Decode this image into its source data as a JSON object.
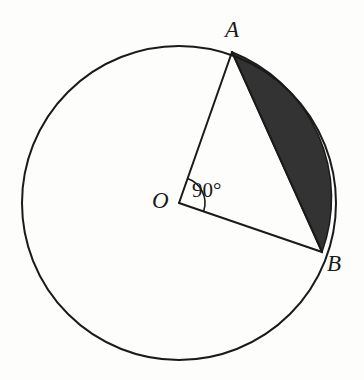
{
  "figure": {
    "background_color": "#fdfdfc",
    "stroke_color": "#1a1a1a",
    "shaded_fill_color": "#333333",
    "circle": {
      "center_x": 179,
      "center_y": 203,
      "radius": 157,
      "stroke_width": 2
    },
    "labels": {
      "point_a": "A",
      "point_b": "B",
      "center_o": "O",
      "angle": "90°"
    },
    "points": {
      "a": {
        "x": 232,
        "y": 52
      },
      "b": {
        "x": 322,
        "y": 252
      },
      "o": {
        "x": 179,
        "y": 203
      }
    },
    "radii": [
      {
        "name": "OA",
        "from": "O",
        "to": "A"
      },
      {
        "name": "OB",
        "from": "O",
        "to": "B"
      }
    ],
    "chord": {
      "name": "AB",
      "from": "A",
      "to": "B"
    },
    "shaded_region": {
      "name": "minor-segment-AB",
      "description": "Region between chord AB and minor arc AB",
      "fill": "#333333"
    },
    "angle_arc": {
      "vertex": "O",
      "measure_degrees": 90,
      "radius": 26
    }
  }
}
